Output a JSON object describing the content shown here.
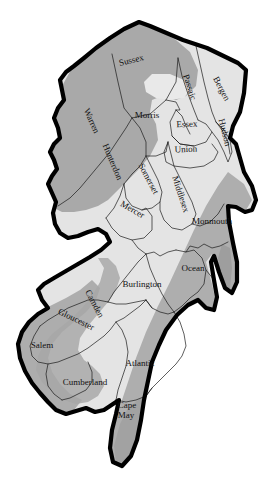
{
  "map": {
    "title": "New Jersey Counties",
    "region": "New Jersey",
    "projection": "plain",
    "background_color": "#ffffff",
    "outline_color": "#000000",
    "border_color": "#1a1a1a",
    "fill_light": "#e2e2e2",
    "fill_mid": "#d0d0d0",
    "fill_dark": "#a8a8a8",
    "label_color": "#111111",
    "counties": [
      {
        "id": "sussex",
        "label": "Sussex",
        "x": 132,
        "y": 63,
        "rotate": -14,
        "size": 9.5,
        "shade": "dark"
      },
      {
        "id": "passaic",
        "label": "Passaic",
        "x": 187,
        "y": 88,
        "rotate": 72,
        "size": 8.5,
        "shade": "dark"
      },
      {
        "id": "bergen",
        "label": "Bergen",
        "x": 219,
        "y": 90,
        "rotate": 62,
        "size": 9.5,
        "shade": "light"
      },
      {
        "id": "warren",
        "label": "Warren",
        "x": 89,
        "y": 122,
        "rotate": 66,
        "size": 9.5,
        "shade": "dark"
      },
      {
        "id": "morris",
        "label": "Morris",
        "x": 147,
        "y": 118,
        "rotate": 0,
        "size": 10,
        "shade": "dark"
      },
      {
        "id": "essex",
        "label": "Essex",
        "x": 187,
        "y": 127,
        "rotate": -2,
        "size": 9,
        "shade": "light"
      },
      {
        "id": "hudson",
        "label": "Hudson",
        "x": 222,
        "y": 133,
        "rotate": 76,
        "size": 8.5,
        "shade": "light"
      },
      {
        "id": "hunterdon",
        "label": "Hunterdon",
        "x": 110,
        "y": 163,
        "rotate": 67,
        "size": 9.5,
        "shade": "dark"
      },
      {
        "id": "union",
        "label": "Union",
        "x": 186,
        "y": 152,
        "rotate": -2,
        "size": 9.5,
        "shade": "light"
      },
      {
        "id": "somerset",
        "label": "Somerset",
        "x": 146,
        "y": 180,
        "rotate": 62,
        "size": 8.5,
        "shade": "light"
      },
      {
        "id": "middlesex",
        "label": "Middlesex",
        "x": 178,
        "y": 195,
        "rotate": 72,
        "size": 8.5,
        "shade": "light"
      },
      {
        "id": "mercer",
        "label": "Mercer",
        "x": 131,
        "y": 212,
        "rotate": 30,
        "size": 9.5,
        "shade": "light"
      },
      {
        "id": "monmouth",
        "label": "Monmouth",
        "x": 212,
        "y": 224,
        "rotate": 0,
        "size": 9.5,
        "shade": "dark"
      },
      {
        "id": "burlington",
        "label": "Burlington",
        "x": 142,
        "y": 287,
        "rotate": 0,
        "size": 10,
        "shade": "light"
      },
      {
        "id": "ocean",
        "label": "Ocean",
        "x": 193,
        "y": 271,
        "rotate": 0,
        "size": 9.5,
        "shade": "light"
      },
      {
        "id": "camden",
        "label": "Camden",
        "x": 92,
        "y": 305,
        "rotate": 62,
        "size": 9,
        "shade": "light"
      },
      {
        "id": "gloucester",
        "label": "Gloucester",
        "x": 75,
        "y": 322,
        "rotate": 26,
        "size": 9,
        "shade": "dark"
      },
      {
        "id": "salem",
        "label": "Salem",
        "x": 42,
        "y": 348,
        "rotate": 0,
        "size": 9.5,
        "shade": "dark"
      },
      {
        "id": "atlantic",
        "label": "Atlantic",
        "x": 140,
        "y": 366,
        "rotate": 0,
        "size": 9.5,
        "shade": "light"
      },
      {
        "id": "cumberland",
        "label": "Cumberland",
        "x": 85,
        "y": 385,
        "rotate": 0,
        "size": 9.5,
        "shade": "dark"
      },
      {
        "id": "capemay",
        "label": "Cape",
        "x": 127,
        "y": 408,
        "rotate": 0,
        "size": 9.5,
        "shade": "dark",
        "label2": "May",
        "x2": 126,
        "y2": 418
      }
    ]
  }
}
